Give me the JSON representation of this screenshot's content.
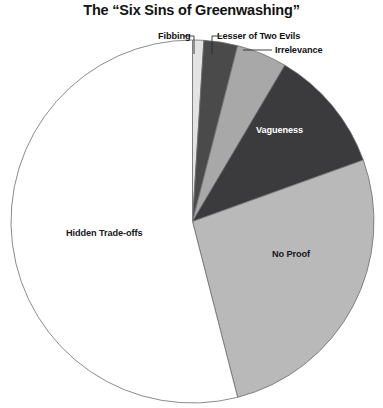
{
  "chart_data": {
    "type": "pie",
    "title": "The “Six Sins of Greenwashing”",
    "categories": [
      "Fibbing",
      "Lesser of Two Evils",
      "Irrelevance",
      "Vagueness",
      "No Proof",
      "Irrelevance_dup_unused"
    ],
    "slices": [
      {
        "label": "Fibbing",
        "value": 1,
        "color": "#e3e3e3",
        "label_placement": "callout"
      },
      {
        "label": "Lesser of Two Evils",
        "value": 3,
        "color": "#4a4a4a",
        "label_placement": "callout"
      },
      {
        "label": "Irrelevance",
        "value": 4.5,
        "color": "#a8a8a8",
        "label_placement": "callout"
      },
      {
        "label": "Vagueness",
        "value": 11,
        "color": "#3b3b3d",
        "label_placement": "inside"
      },
      {
        "label": "No Proof",
        "value": 26.5,
        "color": "#b9b9b9",
        "label_placement": "inside"
      },
      {
        "label": "Hidden Trade-offs",
        "value": 54,
        "color": "#ffffff",
        "label_placement": "inside"
      }
    ],
    "legend": "none",
    "grid": false,
    "xlabel": "",
    "ylabel": "",
    "start_angle_deg": 0,
    "direction": "clockwise",
    "stroke_color": "#6d6d6d"
  },
  "labels": {
    "fibbing": "Fibbing",
    "lesser_of_two_evils": "Lesser of Two Evils",
    "irrelevance": "Irrelevance",
    "vagueness": "Vagueness",
    "no_proof": "No Proof",
    "hidden_tradeoffs": "Hidden Trade-offs"
  },
  "geometry": {
    "cx": 192.5,
    "cy": 221.5,
    "r": 181.5
  }
}
